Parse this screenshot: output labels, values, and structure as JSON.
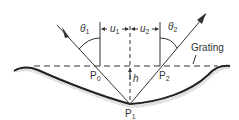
{
  "diagram": {
    "type": "grating-reflection-geometry",
    "labels": {
      "theta1": "θ",
      "theta1_sub": "1",
      "theta2": "θ",
      "theta2_sub": "2",
      "u1": "u",
      "u1_sub": "1",
      "u2": "u",
      "u2_sub": "2",
      "h": "h",
      "grating": "Grating",
      "P0": "P",
      "P0_sub": "0",
      "P1": "P",
      "P1_sub": "1",
      "P2": "P",
      "P2_sub": "2"
    },
    "colors": {
      "line": "#333333",
      "surface": "#222222",
      "hatch": "#9a9a9a"
    }
  }
}
